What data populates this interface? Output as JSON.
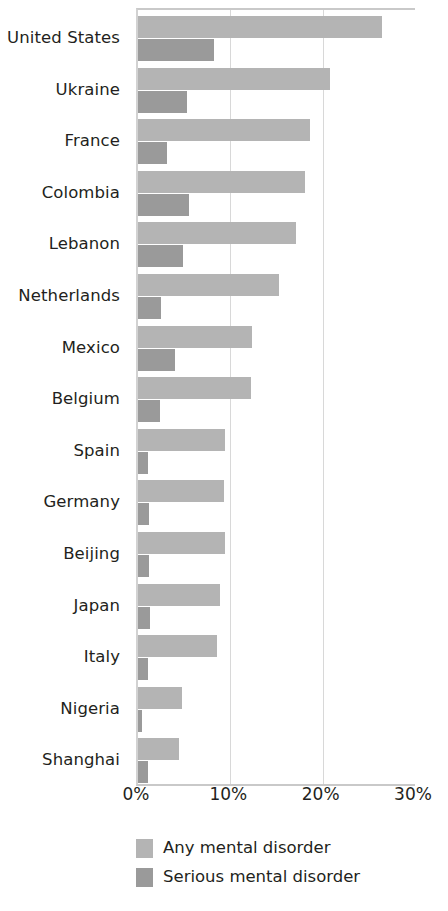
{
  "chart_data": {
    "type": "bar",
    "orientation": "horizontal",
    "title": "",
    "subtitle": "",
    "xlabel": "",
    "ylabel": "",
    "xlim": [
      0,
      30
    ],
    "xtick_labels": [
      "0%",
      "10%",
      "20%",
      "30%"
    ],
    "xtick_values": [
      0,
      10,
      20,
      30
    ],
    "grid": true,
    "grid_axis": "x",
    "legend_position": "bottom-left",
    "value_unit": "%",
    "categories": [
      "United States",
      "Ukraine",
      "France",
      "Colombia",
      "Lebanon",
      "Netherlands",
      "Mexico",
      "Belgium",
      "Spain",
      "Germany",
      "Beijing",
      "Japan",
      "Italy",
      "Nigeria",
      "Shanghai"
    ],
    "series": [
      {
        "name": "Any mental disorder",
        "color": "#b4b4b4",
        "values": [
          26.4,
          20.8,
          18.6,
          18.1,
          17.1,
          15.3,
          12.4,
          12.2,
          9.4,
          9.3,
          9.4,
          8.9,
          8.6,
          4.8,
          4.4
        ]
      },
      {
        "name": "Serious mental disorder",
        "color": "#9a9a9a",
        "values": [
          8.2,
          5.3,
          3.1,
          5.5,
          4.9,
          2.5,
          4.0,
          2.4,
          1.1,
          1.2,
          1.2,
          1.3,
          1.1,
          0.4,
          1.1
        ]
      }
    ]
  },
  "legend": {
    "items": [
      {
        "label": "Any mental disorder",
        "color": "#b4b4b4"
      },
      {
        "label": "Serious mental disorder",
        "color": "#9a9a9a"
      }
    ]
  },
  "colors": {
    "background": "#ffffff",
    "text": "#231f20",
    "gridline": "#d8d8d8",
    "axis": "#c9c9c9",
    "series_any": "#b4b4b4",
    "series_serious": "#9a9a9a"
  }
}
